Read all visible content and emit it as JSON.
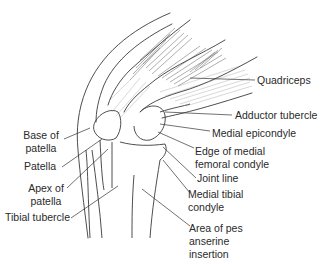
{
  "figure": {
    "labels": [
      {
        "id": "quadriceps",
        "text": "Quadriceps"
      },
      {
        "id": "adductor-tubercle",
        "text": "Adductor tubercle"
      },
      {
        "id": "medial-epicondyle",
        "text": "Medial epicondyle"
      },
      {
        "id": "base-of-patella",
        "text": "Base of\npatella"
      },
      {
        "id": "edge-of-medial-femoral-condyle",
        "text": "Edge of medial\nfemoral condyle"
      },
      {
        "id": "patella",
        "text": "Patella"
      },
      {
        "id": "joint-line",
        "text": "Joint line"
      },
      {
        "id": "apex-of-patella",
        "text": "Apex of\npatella"
      },
      {
        "id": "medial-tibial-condyle",
        "text": "Medial tibial\ncondyle"
      },
      {
        "id": "tibial-tubercle",
        "text": "Tibial tubercle"
      },
      {
        "id": "area-of-pes-anserine-insertion",
        "text": "Area of pes\nanserine\ninsertion"
      }
    ]
  }
}
